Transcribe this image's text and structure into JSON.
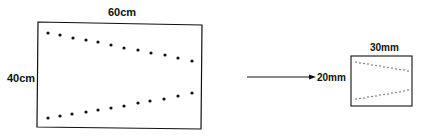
{
  "large_panel": {
    "width_label": "60cm",
    "height_label": "40cm",
    "dots_per_row": 12
  },
  "small_panel": {
    "width_label": "30mm",
    "height_label": "20mm",
    "dots_per_row": 14
  },
  "arrow": {
    "direction": "right"
  },
  "colors": {
    "ink": "#111111",
    "background": "#ffffff"
  }
}
